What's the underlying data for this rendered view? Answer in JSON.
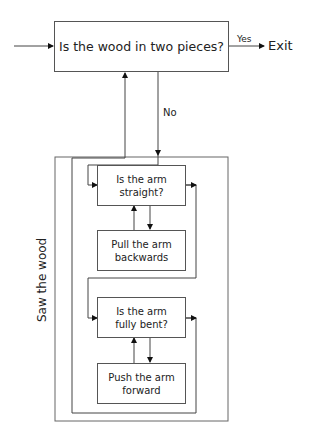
{
  "diagram": {
    "decision_main": "Is the wood in two pieces?",
    "yes_label": "Yes",
    "no_label": "No",
    "exit_label": "Exit",
    "group_label": "Saw the wood",
    "steps": [
      {
        "text": "Is the arm straight?",
        "line1": "Is the arm",
        "line2": "straight?",
        "type": "decision"
      },
      {
        "text": "Pull the arm backwards",
        "line1": "Pull the arm",
        "line2": "backwards",
        "type": "action"
      },
      {
        "text": "Is the arm fully bent?",
        "line1": "Is the arm",
        "line2": "fully bent?",
        "type": "decision"
      },
      {
        "text": "Push the arm forward",
        "line1": "Push the arm",
        "line2": "forward",
        "type": "action"
      }
    ]
  }
}
